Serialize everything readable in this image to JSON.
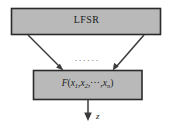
{
  "diagram": {
    "title_hidden": "",
    "background_color": "#ffffff",
    "box_fill_color": "#b9b9b9",
    "box_border_color": "#2b2b2b",
    "arrow_color": "#3a3a3a",
    "upper_block": {
      "label": "LFSR"
    },
    "lower_block": {
      "function_name": "F",
      "open_paren": "(",
      "var1_base": "x",
      "var1_sub": "1",
      "comma1": ",",
      "var2_base": "x",
      "var2_sub": "2",
      "comma2": ",",
      "midline_dots": "⋯",
      "comma3": ",",
      "varn_base": "x",
      "varn_sub": "n",
      "close_paren": ")"
    },
    "tap_ellipsis": "······",
    "output": {
      "label": "z"
    }
  }
}
